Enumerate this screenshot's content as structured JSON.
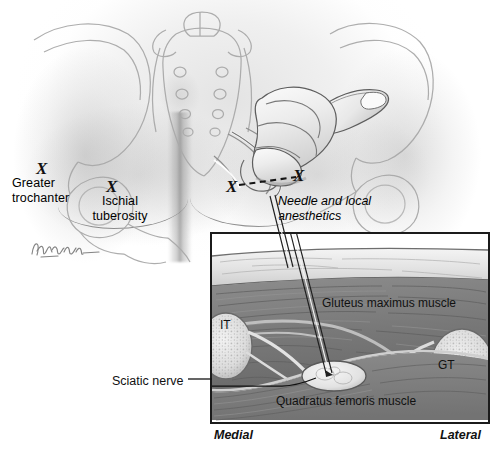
{
  "figure": {
    "domain": "medical-illustration",
    "artist_signature": "illustrator-signature"
  },
  "main_view": {
    "labels": [
      {
        "id": "greater-trochanter",
        "line1": "Greater",
        "line2": "trochanter",
        "marker": "X"
      },
      {
        "id": "ischial-tuberosity",
        "line1": "Ischial",
        "line2": "tuberosity",
        "marker": "X"
      }
    ],
    "markers": {
      "insertion_point": "X",
      "landmark_point": "X"
    },
    "needle_label": {
      "line1": "Needle and local",
      "line2": "anesthetics"
    }
  },
  "inset": {
    "labels": {
      "gluteus_maximus": "Gluteus maximus muscle",
      "quadratus_femoris": "Quadratus femoris muscle",
      "sciatic_nerve": "Sciatic nerve",
      "ischial_tuberosity_abbr": "IT",
      "greater_trochanter_abbr": "GT"
    },
    "orientation": {
      "left": "Medial",
      "right": "Lateral"
    }
  },
  "colors": {
    "ink": "#111111",
    "border": "#1b1b1b",
    "muscle_dark": "#6e6e6e",
    "muscle_mid": "#8a8a8a",
    "fascia_light": "#dcdcdc",
    "bone_light": "#e6e6e6",
    "background": "#ffffff"
  }
}
